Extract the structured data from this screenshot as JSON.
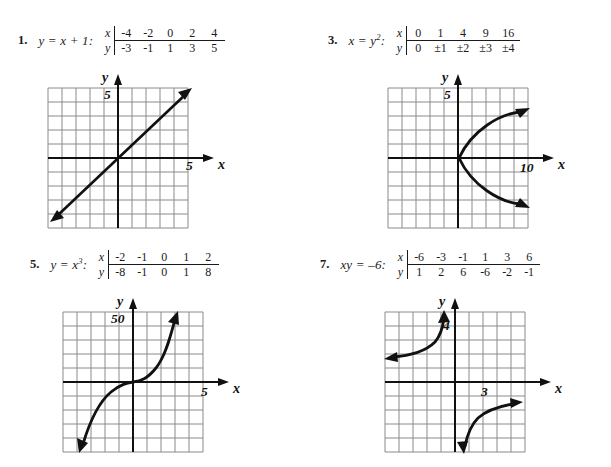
{
  "page": {
    "background": "#ffffff",
    "ink_color": "#1a1a1a",
    "grid_color": "#8a8a8a"
  },
  "problems": [
    {
      "number": "1.",
      "equation_html": "y = x + 1:",
      "equation_plain": "y = x + 1:",
      "table": {
        "row_labels": [
          "x",
          "y"
        ],
        "x_values": [
          "-4",
          "-2",
          "0",
          "2",
          "4"
        ],
        "y_values": [
          "-3",
          "-1",
          "1",
          "3",
          "5"
        ]
      },
      "graph": {
        "name": "line-graph",
        "curve_type": "line",
        "y_axis_label": "y",
        "x_axis_label": "x",
        "y_tick_label": "5",
        "x_tick_label": "5",
        "grid_cols": 10,
        "grid_rows": 10
      }
    },
    {
      "number": "3.",
      "equation_html": "x = y<sup>2</sup>:",
      "equation_plain": "x = y^2:",
      "table": {
        "row_labels": [
          "x",
          "y"
        ],
        "x_values": [
          "0",
          "1",
          "4",
          "9",
          "16"
        ],
        "y_values": [
          "0",
          "±1",
          "±2",
          "±3",
          "±4"
        ]
      },
      "graph": {
        "name": "sideways-parabola-graph",
        "curve_type": "sideways-parabola",
        "y_axis_label": "y",
        "x_axis_label": "x",
        "y_tick_label": "5",
        "x_tick_label": "10",
        "grid_cols": 10,
        "grid_rows": 10
      }
    },
    {
      "number": "5.",
      "equation_html": "y = x<sup>3</sup>:",
      "equation_plain": "y = x^3:",
      "table": {
        "row_labels": [
          "x",
          "y"
        ],
        "x_values": [
          "-2",
          "-1",
          "0",
          "1",
          "2"
        ],
        "y_values": [
          "-8",
          "-1",
          "0",
          "1",
          "8"
        ]
      },
      "graph": {
        "name": "cubic-graph",
        "curve_type": "cubic",
        "y_axis_label": "y",
        "x_axis_label": "x",
        "y_tick_label": "50",
        "x_tick_label": "5",
        "grid_cols": 10,
        "grid_rows": 10
      }
    },
    {
      "number": "7.",
      "equation_html": "xy = –6:",
      "equation_plain": "xy = -6:",
      "table": {
        "row_labels": [
          "x",
          "y"
        ],
        "x_values": [
          "-6",
          "-3",
          "-1",
          "1",
          "3",
          "6"
        ],
        "y_values": [
          "1",
          "2",
          "6",
          "-6",
          "-2",
          "-1"
        ]
      },
      "graph": {
        "name": "hyperbola-graph",
        "curve_type": "hyperbola",
        "y_axis_label": "y",
        "x_axis_label": "x",
        "y_tick_label": "4",
        "x_tick_label": "3",
        "grid_cols": 10,
        "grid_rows": 10
      }
    }
  ],
  "chart_data": [
    {
      "type": "line",
      "title": "y = x + 1",
      "xlabel": "x",
      "ylabel": "y",
      "x": [
        -4,
        -2,
        0,
        2,
        4
      ],
      "values": [
        -3,
        -1,
        1,
        3,
        5
      ],
      "xlim": [
        -5,
        5
      ],
      "ylim": [
        -5,
        5
      ],
      "grid": true,
      "x_tick_label": "5",
      "y_tick_label": "5"
    },
    {
      "type": "line",
      "title": "x = y^2",
      "xlabel": "x",
      "ylabel": "y",
      "x": [
        0,
        1,
        4,
        9,
        16
      ],
      "values": [
        "0",
        "±1",
        "±2",
        "±3",
        "±4"
      ],
      "xlim": [
        -10,
        20
      ],
      "ylim": [
        -5,
        5
      ],
      "grid": true,
      "x_tick_label": "10",
      "y_tick_label": "5"
    },
    {
      "type": "line",
      "title": "y = x^3",
      "xlabel": "x",
      "ylabel": "y",
      "x": [
        -2,
        -1,
        0,
        1,
        2
      ],
      "values": [
        -8,
        -1,
        0,
        1,
        8
      ],
      "xlim": [
        -5,
        5
      ],
      "ylim": [
        -50,
        50
      ],
      "grid": true,
      "x_tick_label": "5",
      "y_tick_label": "50"
    },
    {
      "type": "line",
      "title": "xy = -6",
      "xlabel": "x",
      "ylabel": "y",
      "x": [
        -6,
        -3,
        -1,
        1,
        3,
        6
      ],
      "values": [
        1,
        2,
        6,
        -6,
        -2,
        -1
      ],
      "xlim": [
        -5,
        5
      ],
      "ylim": [
        -4,
        4
      ],
      "grid": true,
      "x_tick_label": "3",
      "y_tick_label": "4"
    }
  ]
}
